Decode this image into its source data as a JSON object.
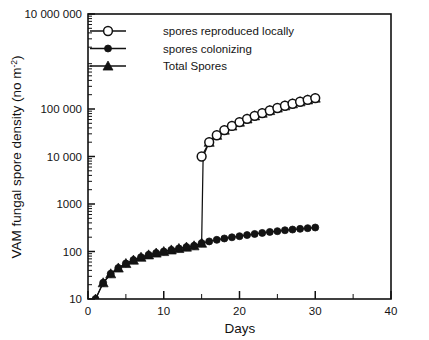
{
  "chart_data": {
    "type": "line",
    "title": "",
    "xlabel": "Days",
    "ylabel": "VAM fungal spore density (no m",
    "ylabel_sup": "-2",
    "ylabel_tail": ")",
    "yscale": "log",
    "xscale": "linear",
    "xlim": [
      0,
      40
    ],
    "ylim": [
      10,
      10000000
    ],
    "grid": false,
    "legend_position": "top-left inside axes",
    "x_ticks_major": [
      0,
      10,
      20,
      30,
      40
    ],
    "x_ticklabels": [
      "0",
      "10",
      "20",
      "30",
      "40"
    ],
    "x_ticks_minor": [
      5,
      15,
      25,
      35
    ],
    "y_ticks_major": [
      10,
      100,
      1000,
      10000,
      100000,
      10000000
    ],
    "y_ticklabels": [
      "10",
      "100",
      "1000",
      "10 000",
      "100 000",
      "10 000 000"
    ],
    "series": [
      {
        "name": "spores reproduced locally",
        "marker": "open-circle",
        "x": [
          15,
          16,
          17,
          18,
          19,
          20,
          21,
          22,
          23,
          24,
          25,
          26,
          27,
          28,
          29,
          30
        ],
        "values": [
          10000,
          20000,
          28000,
          36000,
          44000,
          53000,
          62000,
          72000,
          82000,
          93000,
          105000,
          117000,
          129000,
          142000,
          156000,
          170000
        ]
      },
      {
        "name": "spores colonizing",
        "marker": "filled-circle",
        "x": [
          1,
          2,
          3,
          4,
          5,
          6,
          7,
          8,
          9,
          10,
          11,
          12,
          13,
          14,
          15,
          16,
          17,
          18,
          19,
          20,
          21,
          22,
          23,
          24,
          25,
          26,
          27,
          28,
          29,
          30
        ],
        "values": [
          10,
          22,
          34,
          45,
          56,
          66,
          76,
          85,
          93,
          100,
          108,
          116,
          124,
          132,
          150,
          163,
          176,
          188,
          199,
          210,
          222,
          234,
          246,
          258,
          268,
          280,
          290,
          300,
          310,
          320
        ]
      },
      {
        "name": "Total Spores",
        "marker": "filled-triangle",
        "x": [
          1,
          2,
          3,
          4,
          5,
          6,
          7,
          8,
          9,
          10,
          11,
          12,
          13,
          14,
          15,
          15.2,
          16,
          17,
          18,
          19,
          20,
          21,
          22,
          23,
          24,
          25,
          26,
          27,
          28,
          29,
          30
        ],
        "values": [
          10,
          22,
          34,
          45,
          56,
          66,
          76,
          85,
          93,
          100,
          108,
          116,
          124,
          132,
          150,
          10000,
          20000,
          28000,
          36000,
          44000,
          53000,
          62000,
          72000,
          82000,
          93000,
          105000,
          117000,
          129000,
          142000,
          156000,
          170000
        ]
      }
    ]
  },
  "legend": {
    "entries": [
      {
        "label": "spores reproduced locally",
        "marker": "open-circle"
      },
      {
        "label": "spores colonizing",
        "marker": "filled-circle"
      },
      {
        "label": "Total Spores",
        "marker": "filled-triangle"
      }
    ]
  },
  "colors": {
    "ink": "#111111",
    "marker_fill": "#131313",
    "open_marker_fill": "#ffffff",
    "background": "#ffffff"
  }
}
